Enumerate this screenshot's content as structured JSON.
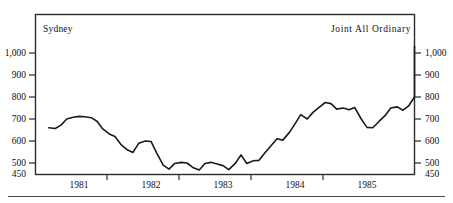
{
  "figure": {
    "left_title": "Sydney",
    "right_title": "Joint All Ordinary",
    "line_color": "#1a1a1a",
    "frame_color": "#2b2b2b",
    "rule_color": "#4a4a4a",
    "background": "#ffffff"
  },
  "chart_data": {
    "type": "line",
    "title": "Sydney",
    "subtitle": "Joint All Ordinary",
    "xlabel": "",
    "ylabel": "",
    "xlim": [
      1980.5,
      1985.75
    ],
    "ylim": [
      450,
      1060
    ],
    "grid": false,
    "legend": "none",
    "y_ticks": [
      450,
      500,
      600,
      700,
      800,
      900,
      1000
    ],
    "y_tick_labels": [
      "450",
      "500",
      "600",
      "700",
      "800",
      "900",
      "1,000"
    ],
    "x_ticks": [
      1981,
      1982,
      1983,
      1984,
      1985
    ],
    "x_tick_labels": [
      "1981",
      "1982",
      "1983",
      "1984",
      "1985"
    ],
    "series": [
      {
        "name": "Joint All Ordinary",
        "x": [
          1980.58,
          1980.67,
          1980.75,
          1980.83,
          1980.92,
          1981.0,
          1981.08,
          1981.17,
          1981.25,
          1981.33,
          1981.42,
          1981.5,
          1981.58,
          1981.67,
          1981.75,
          1981.83,
          1981.92,
          1982.0,
          1982.08,
          1982.17,
          1982.25,
          1982.33,
          1982.42,
          1982.5,
          1982.58,
          1982.67,
          1982.75,
          1982.83,
          1982.92,
          1983.0,
          1983.08,
          1983.17,
          1983.25,
          1983.33,
          1983.42,
          1983.5,
          1983.58,
          1983.67,
          1983.75,
          1983.83,
          1983.92,
          1984.0,
          1984.08,
          1984.17,
          1984.25,
          1984.33,
          1984.42,
          1984.5,
          1984.58,
          1984.67,
          1984.75,
          1984.83,
          1984.92,
          1985.0,
          1985.08,
          1985.17,
          1985.25,
          1985.33,
          1985.42,
          1985.5,
          1985.58,
          1985.67
        ],
        "values": [
          660,
          657,
          672,
          700,
          708,
          712,
          710,
          706,
          690,
          655,
          632,
          620,
          585,
          560,
          548,
          590,
          600,
          598,
          545,
          490,
          472,
          498,
          503,
          500,
          480,
          468,
          498,
          503,
          495,
          488,
          470,
          498,
          537,
          498,
          510,
          512,
          545,
          580,
          610,
          604,
          638,
          678,
          720,
          700,
          730,
          752,
          775,
          770,
          745,
          750,
          742,
          752,
          700,
          662,
          660,
          690,
          715,
          750,
          755,
          740,
          760,
          800
        ]
      }
    ],
    "series_tail": {
      "x": [
        1985.7,
        1985.78,
        1985.85,
        1985.92,
        1986.0,
        1986.08,
        1986.17,
        1986.25
      ],
      "values": [
        855,
        878,
        875,
        900,
        930,
        945,
        1030,
        1000
      ]
    }
  }
}
